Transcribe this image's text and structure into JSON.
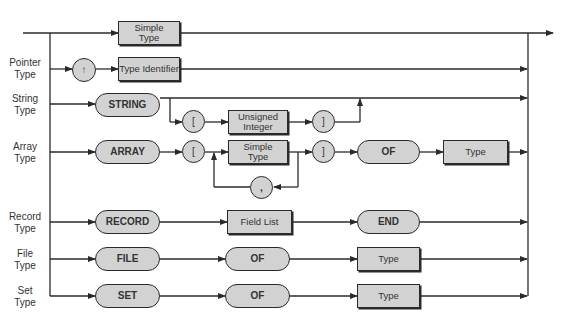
{
  "diagram": {
    "type": "syntax-diagram",
    "rows": [
      {
        "label": "",
        "nodes": [
          "Simple Type"
        ]
      },
      {
        "label": "Pointer Type",
        "nodes": [
          "↑",
          "Type Identifier"
        ]
      },
      {
        "label": "String Type",
        "nodes": [
          "STRING",
          "[",
          "Unsigned Integer",
          "]"
        ],
        "optional_part": [
          "[",
          "Unsigned Integer",
          "]"
        ]
      },
      {
        "label": "Array Type",
        "nodes": [
          "ARRAY",
          "[",
          "Simple Type",
          "]",
          "OF",
          "Type"
        ],
        "repeat_separator": ","
      },
      {
        "label": "Record Type",
        "nodes": [
          "RECORD",
          "Field List",
          "END"
        ]
      },
      {
        "label": "File Type",
        "nodes": [
          "FILE",
          "OF",
          "Type"
        ]
      },
      {
        "label": "Set Type",
        "nodes": [
          "SET",
          "OF",
          "Type"
        ]
      }
    ]
  },
  "labels": {
    "pointer": "Pointer\nType",
    "string": "String\nType",
    "array": "Array\nType",
    "record": "Record\nType",
    "file": "File\nType",
    "set": "Set\nType"
  },
  "nodes": {
    "simple_type_1": "Simple Type",
    "caret": "↑",
    "type_identifier": "Type Identifier",
    "string_kw": "STRING",
    "lbracket_1": "[",
    "unsigned_integer": "Unsigned Integer",
    "rbracket_1": "]",
    "array_kw": "ARRAY",
    "lbracket_2": "[",
    "simple_type_2": "Simple Type",
    "rbracket_2": "]",
    "of_1": "OF",
    "type_1": "Type",
    "comma": ",",
    "record_kw": "RECORD",
    "field_list": "Field List",
    "end_kw": "END",
    "file_kw": "FILE",
    "of_2": "OF",
    "type_2": "Type",
    "set_kw": "SET",
    "of_3": "OF",
    "type_3": "Type"
  },
  "colors": {
    "node_fill": "#d2d2d2",
    "stroke": "#2a2a2a",
    "background": "#ffffff"
  }
}
